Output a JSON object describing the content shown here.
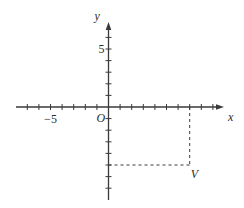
{
  "chart_data": {
    "type": "scatter",
    "title": "",
    "xlabel": "x",
    "ylabel": "y",
    "origin_label": "O",
    "xlim": [
      -8,
      9.5
    ],
    "ylim": [
      -7.5,
      7.2
    ],
    "x_tick_labels": [
      {
        "value": -5,
        "label": "−5"
      }
    ],
    "y_tick_labels": [
      {
        "value": 5,
        "label": "5"
      }
    ],
    "x_ticks": [
      -7,
      -6,
      -5,
      -4,
      -3,
      -2,
      -1,
      1,
      2,
      3,
      4,
      5,
      6,
      7,
      8,
      9
    ],
    "y_ticks": [
      -7,
      -6,
      -5,
      -4,
      -3,
      -2,
      -1,
      1,
      2,
      3,
      4,
      5,
      6
    ],
    "grid": false,
    "points": [
      {
        "label": "V",
        "x": 7,
        "y": -5
      }
    ],
    "annotations": [
      {
        "type": "dashed-projection",
        "from_point": "V",
        "to": "x-axis"
      },
      {
        "type": "dashed-projection",
        "from_point": "V",
        "to": "y-axis"
      }
    ],
    "colors": {
      "axis": "#3a3a3a",
      "text": "#2a2a2a",
      "background": "#ffffff"
    }
  }
}
